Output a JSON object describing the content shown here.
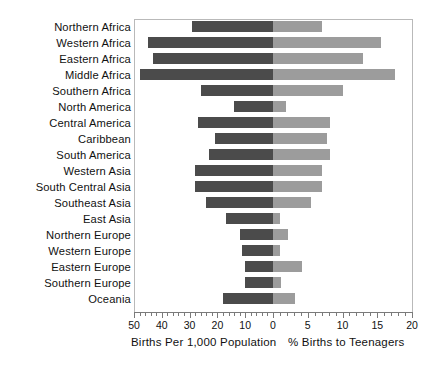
{
  "chart_data": {
    "type": "bar",
    "title": "",
    "subtitle": "",
    "orientation": "horizontal-diverging",
    "grid": false,
    "legend_position": "none",
    "categories": [
      "Northern Africa",
      "Western Africa",
      "Eastern Africa",
      "Middle Africa",
      "Southern Africa",
      "North America",
      "Central America",
      "Caribbean",
      "South America",
      "Western Asia",
      "South Central Asia",
      "Southeast Asia",
      "East Asia",
      "Northern Europe",
      "Western Europe",
      "Eastern Europe",
      "Southern Europe",
      "Oceania"
    ],
    "series": [
      {
        "name": "Births Per 1,000 Population",
        "axis": "left",
        "color": "#4b4b4b",
        "direction": "left",
        "xlabel": "Births Per 1,000 Population",
        "xlim": [
          0,
          50
        ],
        "ticks": [
          50,
          40,
          30,
          20,
          10,
          0
        ],
        "values": [
          29,
          45,
          43,
          48,
          26,
          14,
          27,
          21,
          23,
          28,
          28,
          24,
          17,
          12,
          11,
          10,
          10,
          18
        ]
      },
      {
        "name": "% Births to Teenagers",
        "axis": "right",
        "color": "#9c9c9c",
        "direction": "right",
        "xlabel": "% Births to Teenagers",
        "xlim": [
          0,
          20
        ],
        "ticks": [
          0,
          5,
          10,
          15,
          20
        ],
        "values": [
          7.0,
          15.5,
          13.0,
          17.5,
          10.0,
          1.8,
          8.2,
          7.8,
          8.2,
          7.0,
          7.0,
          5.4,
          1.0,
          2.2,
          1.0,
          4.2,
          1.1,
          3.2
        ]
      }
    ]
  },
  "axis": {
    "left_title": "Births Per 1,000 Population",
    "right_title": "% Births to Teenagers",
    "left_ticks": [
      "50",
      "40",
      "30",
      "20",
      "10",
      "0"
    ],
    "right_ticks": [
      "5",
      "10",
      "15",
      "20"
    ]
  }
}
